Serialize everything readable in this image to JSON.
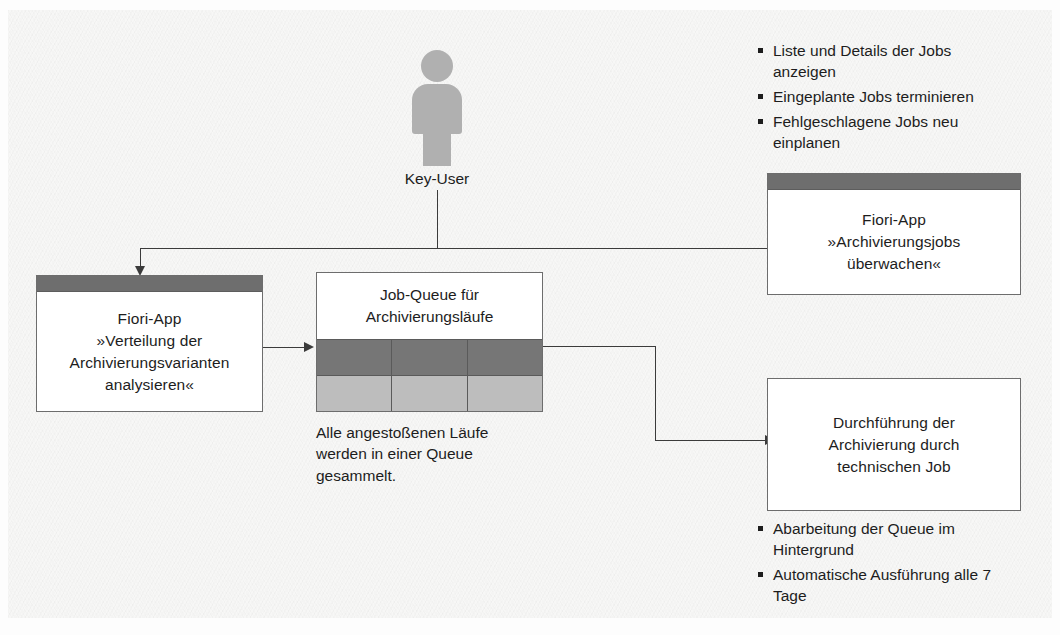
{
  "diagram": {
    "actor": {
      "label": "Key-User",
      "icon": "person-icon"
    },
    "boxes": {
      "fiori_monitor": {
        "line1": "Fiori-App",
        "line2": "»Archivierungsjobs",
        "line3": "überwachen«"
      },
      "fiori_analyze": {
        "line1": "Fiori-App",
        "line2": "»Verteilung der",
        "line3": "Archivierungsvarianten",
        "line4": "analysieren«"
      },
      "technical_job": {
        "line1": "Durchführung der",
        "line2": "Archivierung durch",
        "line3": "technischen Job"
      }
    },
    "queue": {
      "title_line1": "Job-Queue für",
      "title_line2": "Archivierungsläufe",
      "caption_line1": "Alle angestoßenen Läufe",
      "caption_line2": "werden in einer Queue",
      "caption_line3": "gesammelt.",
      "rows": [
        {
          "style": "dark",
          "cells": 3
        },
        {
          "style": "light",
          "cells": 3
        }
      ]
    },
    "bullets_top": [
      "Liste und Details der Jobs anzeigen",
      "Eingeplante Jobs terminieren",
      "Fehlgeschlagene Jobs neu einplanen"
    ],
    "bullets_bottom": [
      "Abarbeitung der Queue im Hintergrund",
      "Automatische Ausführung alle 7 Tage"
    ],
    "colors": {
      "box_header": "#6e6e6e",
      "queue_dark_row": "#767676",
      "queue_light_row": "#bdbdbd",
      "actor_fill": "#b0b0b0",
      "line": "#3b3b3b",
      "text": "#1d1d1d",
      "panel_background": "#f7f7f6"
    }
  }
}
